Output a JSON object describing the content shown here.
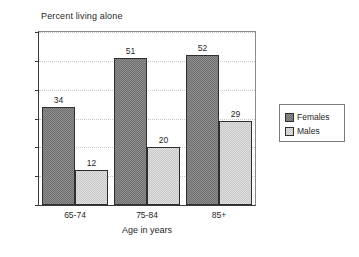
{
  "chart_data": {
    "type": "bar",
    "title": "Percent living alone",
    "xlabel": "Age in years",
    "ylabel": "",
    "categories": [
      "65-74",
      "75-84",
      "85+"
    ],
    "series": [
      {
        "name": "Females",
        "values": [
          34,
          51,
          52
        ],
        "color": "#8e8e8e"
      },
      {
        "name": "Males",
        "values": [
          12,
          20,
          29
        ],
        "color": "#e2e2e2"
      }
    ],
    "ylim": [
      0,
      60
    ],
    "yticks": [
      0,
      10,
      20,
      30,
      40,
      50,
      60
    ],
    "ytick_labels": [
      "0",
      "10",
      "20",
      "30",
      "40",
      "50",
      "60"
    ],
    "grid": true,
    "grid_style": "dotted-horizontal",
    "legend_position": "right-outside",
    "data_labels": true,
    "background": "#ffffff",
    "axis_color": "#3a3a3a"
  }
}
